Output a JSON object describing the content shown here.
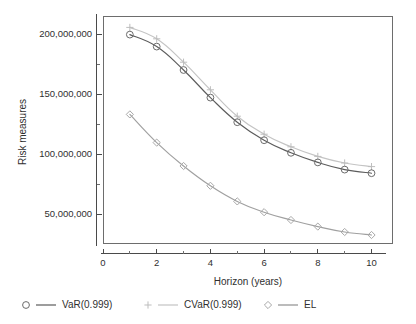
{
  "figure": {
    "background": "#ffffff",
    "plot_frame": {
      "left": 103,
      "top": 16,
      "right": 393,
      "bottom": 244
    }
  },
  "chart_data": {
    "type": "line",
    "title": "",
    "xlabel": "Horizon (years)",
    "ylabel": "Risk measures",
    "x": [
      1,
      2,
      3,
      4,
      5,
      6,
      7,
      8,
      9,
      10
    ],
    "xlim": [
      0,
      10.8
    ],
    "ylim": [
      25000000,
      215000000
    ],
    "xticks": [
      0,
      1,
      2,
      3,
      4,
      5,
      6,
      7,
      8,
      9,
      10
    ],
    "xtick_labels": [
      "0",
      "",
      "2",
      "",
      "4",
      "",
      "6",
      "",
      "8",
      "",
      "10"
    ],
    "yticks": [
      50000000,
      75000000,
      100000000,
      125000000,
      150000000,
      175000000,
      200000000
    ],
    "ytick_labels": [
      "50,000,000",
      "",
      "100,000,000",
      "",
      "150,000,000",
      "",
      "200,000,000"
    ],
    "grid": false,
    "legend_position": "below",
    "series": [
      {
        "name": "VaR(0.999)",
        "marker": "circle",
        "color": "#5c5c5c",
        "marker_color": "#6b6b6b",
        "values": [
          199500000,
          189500000,
          170000000,
          147000000,
          126500000,
          111500000,
          101000000,
          93000000,
          87000000,
          84000000
        ]
      },
      {
        "name": "CVaR(0.999)",
        "marker": "plus",
        "color": "#c4c4c4",
        "marker_color": "#bdbdbd",
        "values": [
          205500000,
          196000000,
          176500000,
          153500000,
          131500000,
          116500000,
          106000000,
          98000000,
          92500000,
          89500000
        ]
      },
      {
        "name": "EL",
        "marker": "diamond",
        "color": "#a0a0a0",
        "marker_color": "#a8a8a8",
        "values": [
          133000000,
          109500000,
          90000000,
          73500000,
          60500000,
          51500000,
          45000000,
          39500000,
          35000000,
          32500000
        ]
      }
    ]
  },
  "legend": {
    "entries": [
      {
        "label": "VaR(0.999)",
        "marker": "circle",
        "color": "#6b6b6b",
        "line_color": "#5c5c5c"
      },
      {
        "label": "CVaR(0.999)",
        "marker": "plus",
        "color": "#bdbdbd",
        "line_color": "#c4c4c4"
      },
      {
        "label": "EL",
        "marker": "diamond",
        "color": "#a8a8a8",
        "line_color": "#8f8f8f"
      }
    ]
  }
}
